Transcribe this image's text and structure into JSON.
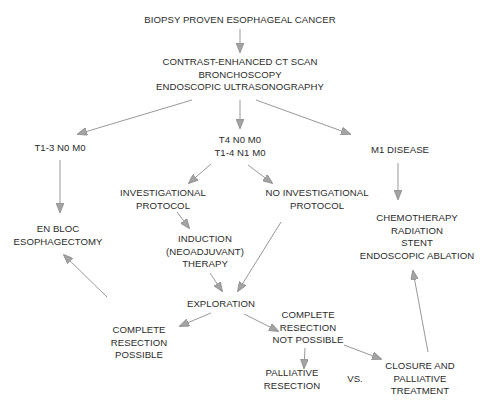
{
  "diagram": {
    "type": "flowchart",
    "colors": {
      "text": "#2b2b2b",
      "arrow_line": "#8c8c8c",
      "arrow_head": "#9a9a9a",
      "background": "#ffffff"
    },
    "nodes": {
      "start": {
        "lines": [
          "BIOPSY PROVEN ESOPHAGEAL CANCER"
        ]
      },
      "staging": {
        "lines": [
          "CONTRAST-ENHANCED CT SCAN",
          "BRONCHOSCOPY",
          "ENDOSCOPIC ULTRASONOGRAPHY"
        ]
      },
      "early": {
        "lines": [
          "T1-3 N0 M0"
        ]
      },
      "locally_advanced": {
        "lines": [
          "T4 N0 M0",
          "T1-4 N1 M0"
        ]
      },
      "metastatic": {
        "lines": [
          "M1 DISEASE"
        ]
      },
      "esophagectomy": {
        "lines": [
          "EN BLOC",
          "ESOPHAGECTOMY"
        ]
      },
      "investigational": {
        "lines": [
          "INVESTIGATIONAL",
          "PROTOCOL"
        ]
      },
      "no_investigational": {
        "lines": [
          "NO INVESTIGATIONAL",
          "PROTOCOL"
        ]
      },
      "palliative_options": {
        "lines": [
          "CHEMOTHERAPY",
          "RADIATION",
          "STENT",
          "ENDOSCOPIC ABLATION"
        ]
      },
      "induction": {
        "lines": [
          "INDUCTION",
          "(NEOADJUVANT)",
          "THERAPY"
        ]
      },
      "exploration": {
        "lines": [
          "EXPLORATION"
        ]
      },
      "resection_possible": {
        "lines": [
          "COMPLETE",
          "RESECTION",
          "POSSIBLE"
        ]
      },
      "resection_not_possible": {
        "lines": [
          "COMPLETE",
          "RESECTION",
          "NOT POSSIBLE"
        ]
      },
      "palliative_resection": {
        "lines": [
          "PALLIATIVE",
          "RESECTION"
        ]
      },
      "versus": {
        "lines": [
          "VS."
        ]
      },
      "closure": {
        "lines": [
          "CLOSURE AND",
          "PALLIATIVE",
          "TREATMENT"
        ]
      }
    },
    "edges": [
      [
        "start",
        "staging"
      ],
      [
        "staging",
        "early"
      ],
      [
        "staging",
        "locally_advanced"
      ],
      [
        "staging",
        "metastatic"
      ],
      [
        "early",
        "esophagectomy"
      ],
      [
        "locally_advanced",
        "investigational"
      ],
      [
        "locally_advanced",
        "no_investigational"
      ],
      [
        "metastatic",
        "palliative_options"
      ],
      [
        "investigational",
        "induction"
      ],
      [
        "induction",
        "exploration"
      ],
      [
        "no_investigational",
        "exploration"
      ],
      [
        "exploration",
        "resection_possible"
      ],
      [
        "exploration",
        "resection_not_possible"
      ],
      [
        "resection_possible",
        "esophagectomy"
      ],
      [
        "resection_not_possible",
        "palliative_resection"
      ],
      [
        "resection_not_possible",
        "closure"
      ],
      [
        "closure",
        "palliative_options"
      ]
    ]
  }
}
